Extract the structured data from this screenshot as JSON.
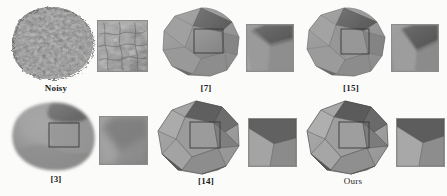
{
  "figure": {
    "type": "mesh-denoising-comparison",
    "background_color": "#fbfbfa",
    "rows": 2,
    "columns": 3
  },
  "palette": {
    "background": "#fbfbfa",
    "face_light": "#a5a5a5",
    "face_mid": "#8e8e8e",
    "face_dark": "#6d6d6d",
    "face_darker": "#575757",
    "face_highlight": "#bcbcbc",
    "edge": "#4a4a4a",
    "roi_box": "#3a3a3a",
    "inset_border": "#8c8c8c",
    "caption": "#1c1c1c"
  },
  "panels": [
    {
      "id": "noisy",
      "label": "Noisy",
      "label_style": "bold",
      "row": 0,
      "column": 0,
      "has_roi_box": false,
      "surface": "heavily-noisy",
      "inset_style": "noisy-detail"
    },
    {
      "id": "ref7",
      "label": "[7]",
      "label_style": "bold",
      "row": 0,
      "column": 1,
      "has_roi_box": true,
      "surface": "partially-smoothed",
      "inset_style": "soft-edge"
    },
    {
      "id": "ref15",
      "label": "[15]",
      "label_style": "bold",
      "row": 0,
      "column": 2,
      "has_roi_box": true,
      "surface": "smoothed-with-residual-noise",
      "inset_style": "blurred-corner"
    },
    {
      "id": "ref3",
      "label": "[3]",
      "label_style": "bold",
      "row": 1,
      "column": 0,
      "has_roi_box": true,
      "surface": "over-smoothed-rounded",
      "inset_style": "rounded-edge"
    },
    {
      "id": "ref14",
      "label": "[14]",
      "label_style": "bold",
      "row": 1,
      "column": 1,
      "has_roi_box": true,
      "surface": "sharp-faceted",
      "inset_style": "sharp-corner"
    },
    {
      "id": "ours",
      "label": "Ours",
      "label_style": "regular",
      "row": 1,
      "column": 2,
      "has_roi_box": true,
      "surface": "sharp-faceted-clean",
      "inset_style": "sharp-corner-clean"
    }
  ]
}
